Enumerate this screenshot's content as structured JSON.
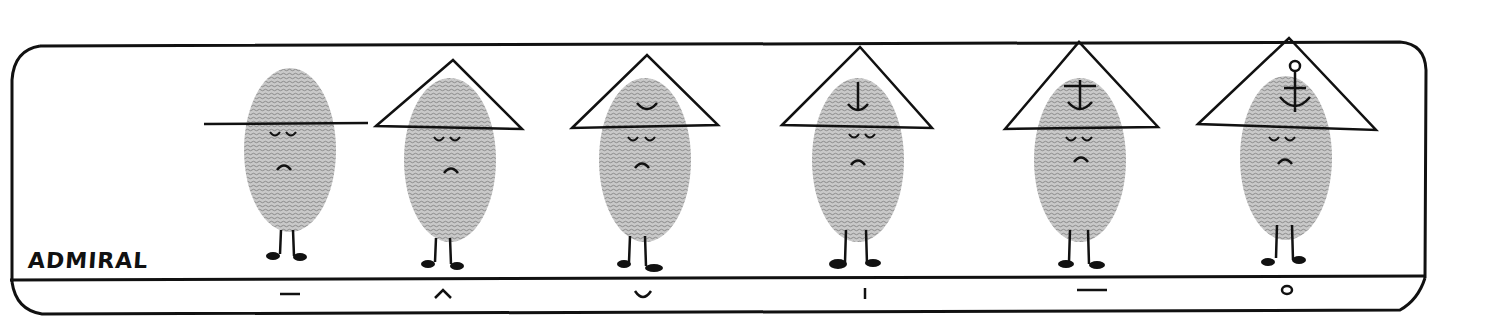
{
  "panel": {
    "title": "ADMIRAL",
    "ink_color": "#111111",
    "fingerprint_color": "#9a9a9a",
    "background": "#ffffff"
  },
  "figures": [
    {
      "index": 0,
      "hat": "brim-line",
      "emblem": "none",
      "caption_mark": "–",
      "cx": 290
    },
    {
      "index": 1,
      "hat": "triangle",
      "emblem": "none",
      "caption_mark": "^",
      "cx": 448
    },
    {
      "index": 2,
      "hat": "triangle",
      "emblem": "curve",
      "caption_mark": "◡",
      "cx": 645
    },
    {
      "index": 3,
      "hat": "triangle",
      "emblem": "curve-with-stem",
      "caption_mark": "|",
      "cx": 858
    },
    {
      "index": 4,
      "hat": "triangle",
      "emblem": "curve-with-stem-and-bar",
      "caption_mark": "–",
      "cx": 1080
    },
    {
      "index": 5,
      "hat": "triangle",
      "emblem": "full-anchor",
      "caption_mark": "o",
      "cx": 1287
    }
  ]
}
